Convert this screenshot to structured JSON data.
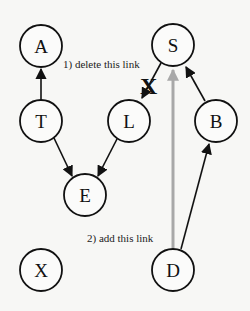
{
  "diagram": {
    "type": "directed-graph",
    "nodes": [
      {
        "id": "A",
        "label": "A",
        "x": 41,
        "y": 46
      },
      {
        "id": "S",
        "label": "S",
        "x": 173,
        "y": 45
      },
      {
        "id": "T",
        "label": "T",
        "x": 41,
        "y": 121
      },
      {
        "id": "L",
        "label": "L",
        "x": 129,
        "y": 121
      },
      {
        "id": "B",
        "label": "B",
        "x": 216,
        "y": 121
      },
      {
        "id": "E",
        "label": "E",
        "x": 85,
        "y": 195
      },
      {
        "id": "X",
        "label": "X",
        "x": 41,
        "y": 270
      },
      {
        "id": "D",
        "label": "D",
        "x": 173,
        "y": 270
      }
    ],
    "edges": [
      {
        "from": "T",
        "to": "A",
        "style": "solid"
      },
      {
        "from": "T",
        "to": "E",
        "style": "solid"
      },
      {
        "from": "L",
        "to": "E",
        "style": "solid"
      },
      {
        "from": "S",
        "to": "L",
        "style": "solid",
        "status": "deleted"
      },
      {
        "from": "B",
        "to": "S",
        "style": "solid"
      },
      {
        "from": "D",
        "to": "B",
        "style": "solid"
      },
      {
        "from": "D",
        "to": "S",
        "style": "gray-thick",
        "status": "added"
      }
    ],
    "annotations": {
      "delete_label": "1) delete this link",
      "delete_mark": "X",
      "add_label": "2) add this link"
    }
  }
}
